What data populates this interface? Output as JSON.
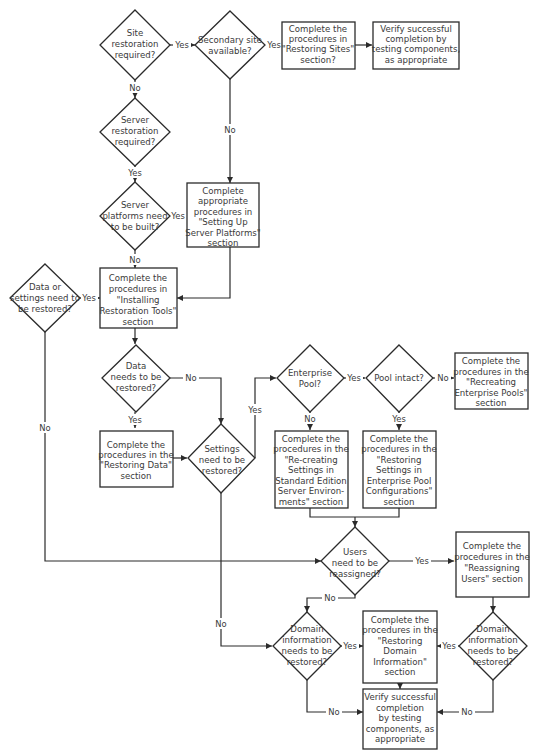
{
  "diagram": {
    "type": "flowchart",
    "nodes": {
      "site_restoration": {
        "kind": "decision",
        "lines": [
          "Site",
          "restoration",
          "required?"
        ]
      },
      "secondary_site": {
        "kind": "decision",
        "lines": [
          "Secondary site",
          "available?"
        ]
      },
      "restoring_sites": {
        "kind": "process",
        "lines": [
          "Complete the",
          "procedures in",
          "\"Restoring Sites\"",
          "section?"
        ]
      },
      "verify_top": {
        "kind": "process",
        "lines": [
          "Verify successful",
          "completion by",
          "testing components,",
          "as appropriate"
        ]
      },
      "server_restoration": {
        "kind": "decision",
        "lines": [
          "Server",
          "restoration",
          "required?"
        ]
      },
      "server_platforms_built": {
        "kind": "decision",
        "lines": [
          "Server",
          "platforms need",
          "to be built?"
        ]
      },
      "setting_up_platforms": {
        "kind": "process",
        "lines": [
          "Complete",
          "appropriate",
          "procedures in",
          "\"Setting Up",
          "Server Platforms\"",
          "section"
        ]
      },
      "data_or_settings": {
        "kind": "decision",
        "lines": [
          "Data or",
          "settings need to",
          "be restored?"
        ]
      },
      "installing_tools": {
        "kind": "process",
        "lines": [
          "Complete the",
          "procedures in",
          "\"Installing",
          "Restoration Tools\"",
          "section"
        ]
      },
      "data_needs_restore": {
        "kind": "decision",
        "lines": [
          "Data",
          "needs to be",
          "restored?"
        ]
      },
      "restoring_data": {
        "kind": "process",
        "lines": [
          "Complete the",
          "procedures in the",
          "\"Restoring Data\"",
          "section"
        ]
      },
      "settings_need_restore": {
        "kind": "decision",
        "lines": [
          "Settings",
          "need to be",
          "restored?"
        ]
      },
      "enterprise_pool": {
        "kind": "decision",
        "lines": [
          "Enterprise",
          "Pool?"
        ]
      },
      "pool_intact": {
        "kind": "decision",
        "lines": [
          "Pool intact?"
        ]
      },
      "recreating_pools": {
        "kind": "process",
        "lines": [
          "Complete the",
          "procedures in the",
          "\"Recreating",
          "Enterprise Pools\"",
          "section"
        ]
      },
      "recreating_standard": {
        "kind": "process",
        "lines": [
          "Complete the",
          "procedures in the",
          "\"Re-creating",
          "Settings in",
          "Standard Edition",
          "Server Environ-",
          "ments\" section"
        ]
      },
      "restoring_pool_settings": {
        "kind": "process",
        "lines": [
          "Complete the",
          "procedures in the",
          "\"Restoring",
          "Settings in",
          "Enterprise Pool",
          "Configurations\"",
          "section"
        ]
      },
      "users_reassigned": {
        "kind": "decision",
        "lines": [
          "Users",
          "need to be",
          "reassigned?"
        ]
      },
      "reassigning_users": {
        "kind": "process",
        "lines": [
          "Complete the",
          "procedures in the",
          "\"Reassigning",
          "Users\" section"
        ]
      },
      "domain_left": {
        "kind": "decision",
        "lines": [
          "Domain",
          "information",
          "needs to be",
          "restored?"
        ]
      },
      "restoring_domain": {
        "kind": "process",
        "lines": [
          "Complete the",
          "procedures in the",
          "\"Restoring",
          "Domain",
          "Information\"",
          "section"
        ]
      },
      "domain_right": {
        "kind": "decision",
        "lines": [
          "Domain",
          "information",
          "needs to be",
          "restored?"
        ]
      },
      "verify_bottom": {
        "kind": "process",
        "lines": [
          "Verify successful",
          "completion",
          "by testing",
          "components, as",
          "appropriate"
        ]
      }
    },
    "edge_labels": {
      "yes": "Yes",
      "no": "No"
    },
    "caption": ""
  }
}
